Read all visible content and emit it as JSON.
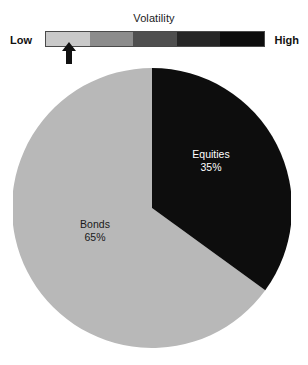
{
  "scale": {
    "title": "Volatility",
    "low_label": "Low",
    "high_label": "High",
    "segments": [
      {
        "name": "segment-1",
        "color": "#c9c9c9"
      },
      {
        "name": "segment-2",
        "color": "#8c8c8c"
      },
      {
        "name": "segment-3",
        "color": "#4f4f4f"
      },
      {
        "name": "segment-4",
        "color": "#262626"
      },
      {
        "name": "segment-5",
        "color": "#0d0d0d"
      }
    ],
    "marker": {
      "icon": "up-arrow-icon",
      "segment_index": 0,
      "position_pct": 11
    }
  },
  "chart_data": {
    "type": "pie",
    "title": "Volatility",
    "xlabel": "",
    "ylabel": "",
    "start_angle_deg": 0,
    "direction": "clockwise",
    "categories": [
      "Equities",
      "Bonds"
    ],
    "values": [
      35,
      65
    ],
    "value_suffix": "%",
    "labels": [
      "Equities\n35%",
      "Bonds\n65%"
    ],
    "slices": [
      {
        "name": "Equities",
        "value": 35,
        "value_label": "35%",
        "color": "#0d0d0d",
        "label_color": "#ffffff"
      },
      {
        "name": "Bonds",
        "value": 65,
        "value_label": "65%",
        "color": "#b8b8b8",
        "label_color": "#1a1a1a"
      }
    ],
    "legend": "none",
    "grid": false,
    "annotations": [
      "Volatility scale from Low to High with marker near the low end"
    ]
  },
  "colors": {
    "background": "#ffffff",
    "equities": "#0d0d0d",
    "bonds": "#b8b8b8",
    "text": "#1a1a1a"
  }
}
